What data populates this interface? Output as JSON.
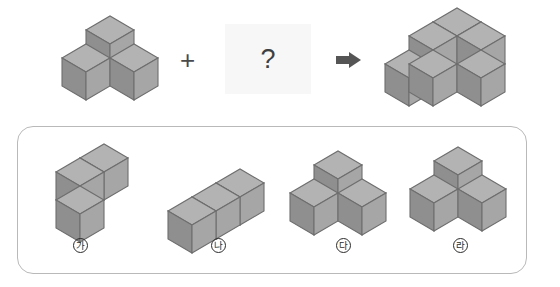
{
  "puzzle": {
    "operator": "+",
    "unknown": "?",
    "arrow": "arrow-right-icon",
    "shapes": {
      "left_label": "L-shaped tromino of cubes",
      "result_label": "target cube assembly"
    }
  },
  "options": {
    "items": [
      {
        "key": "가",
        "name": "option-ga"
      },
      {
        "key": "나",
        "name": "option-na"
      },
      {
        "key": "다",
        "name": "option-da"
      },
      {
        "key": "라",
        "name": "option-ra"
      }
    ]
  },
  "colors": {
    "cube_top": "#b3b3b3",
    "cube_left": "#8f8f8f",
    "cube_right": "#a6a6a6",
    "cube_stroke": "#6e6e6e",
    "panel_border": "#b9b9b9",
    "qbox_bg": "#f7f7f7",
    "text": "#2b2b2b",
    "arrow_fill": "#555555"
  }
}
